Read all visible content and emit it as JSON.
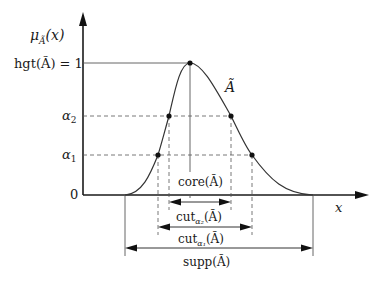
{
  "figure": {
    "type": "fuzzy-set-membership-diagram",
    "fuzzy_set": "Ã",
    "y_axis_label": "μ_Ã(x)",
    "x_axis_label": "x",
    "y_ticks": [
      {
        "label": "hgt(Ã) = 1",
        "value": 1.0
      },
      {
        "label": "α₂",
        "value": 0.6
      },
      {
        "label": "α₁",
        "value": 0.3
      },
      {
        "label": "0",
        "value": 0.0
      }
    ],
    "curve_label": "Ã",
    "intervals": [
      {
        "name": "core",
        "label": "core(Ã)"
      },
      {
        "name": "cut_alpha2",
        "label": "cut_α₂(Ã)"
      },
      {
        "name": "cut_alpha1",
        "label": "cut_α₁(Ã)"
      },
      {
        "name": "support",
        "label": "supp(Ã)"
      }
    ],
    "colors": {
      "background": "#ffffff",
      "ink": "#1a1a1a",
      "guide": "#555555"
    }
  },
  "labels": {
    "mu": "μ",
    "mu_sub": "Ã",
    "mu_arg": "(x)",
    "hgt": "hgt(Ã) = 1",
    "alpha": "α",
    "alpha2_sub": "2",
    "alpha1_sub": "1",
    "zero": "0",
    "x": "x",
    "curve": "Ã",
    "core": "core(Ã)",
    "cut": "cut",
    "cut_a2_sub": "α₂",
    "cut_a1_sub": "α₁",
    "cut_arg": "(Ã)",
    "supp": "supp(Ã)"
  }
}
